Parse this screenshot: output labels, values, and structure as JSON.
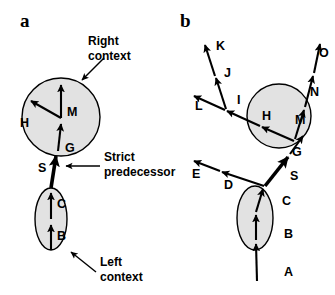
{
  "figure": {
    "width": 335,
    "height": 295,
    "background": "#ffffff",
    "blob_fill": "#e2e2e2",
    "stroke_color": "#000000"
  },
  "panels": [
    {
      "id": "a",
      "label": "a",
      "description": "Single chain of segments with left context ellipse, strict predecessor, and right context circle",
      "annotations": [
        {
          "name": "right-context",
          "text": "Right\ncontext",
          "line1": "Right",
          "line2": "context"
        },
        {
          "name": "strict-predecessor",
          "text": "Strict\npredecessor",
          "line1": "Strict",
          "line2": "predecessor"
        },
        {
          "name": "left-context",
          "text": "Left\ncontext",
          "line1": "Left",
          "line2": "context"
        }
      ],
      "nodes": [
        {
          "name": "segment-b",
          "label": "B"
        },
        {
          "name": "segment-c",
          "label": "C"
        },
        {
          "name": "segment-s",
          "label": "S"
        },
        {
          "name": "segment-g",
          "label": "G"
        },
        {
          "name": "segment-m",
          "label": "M"
        },
        {
          "name": "segment-h",
          "label": "H"
        }
      ]
    },
    {
      "id": "b",
      "label": "b",
      "description": "Branching structure with ellipse left context, strict predecessor S, circle right context and multiple branches",
      "annotations": [],
      "nodes": [
        {
          "name": "segment-a",
          "label": "A"
        },
        {
          "name": "segment-b",
          "label": "B"
        },
        {
          "name": "segment-c",
          "label": "C"
        },
        {
          "name": "segment-d",
          "label": "D"
        },
        {
          "name": "segment-e",
          "label": "E"
        },
        {
          "name": "segment-s",
          "label": "S"
        },
        {
          "name": "segment-g",
          "label": "G"
        },
        {
          "name": "segment-h",
          "label": "H"
        },
        {
          "name": "segment-i",
          "label": "I"
        },
        {
          "name": "segment-j",
          "label": "J"
        },
        {
          "name": "segment-k",
          "label": "K"
        },
        {
          "name": "segment-l",
          "label": "L"
        },
        {
          "name": "segment-m",
          "label": "M"
        },
        {
          "name": "segment-n",
          "label": "N"
        },
        {
          "name": "segment-o",
          "label": "O"
        }
      ]
    }
  ]
}
